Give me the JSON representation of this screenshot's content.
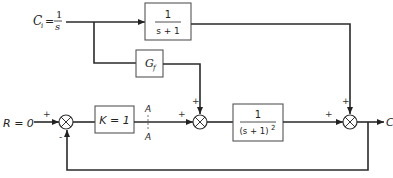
{
  "diagram": {
    "type": "block-diagram",
    "inputs": {
      "reference": {
        "label": "R = 0"
      },
      "disturbance": {
        "label_var": "C",
        "label_sub": "i",
        "label_eq": "=",
        "num": "1",
        "den": "s"
      }
    },
    "output": {
      "label": "C"
    },
    "blocks": [
      {
        "id": "feedforward-plant",
        "num": "1",
        "den": "s + 1"
      },
      {
        "id": "feedforward-gain",
        "label": "G",
        "sub": "f"
      },
      {
        "id": "controller",
        "label": "K = 1"
      },
      {
        "id": "plant",
        "num": "1",
        "den": "(s + 1)",
        "den_exp": "2"
      }
    ],
    "break_point": {
      "top": "A",
      "bottom": "A"
    },
    "summing_junctions": [
      {
        "id": "sum1",
        "signs": [
          "+",
          "-"
        ]
      },
      {
        "id": "sum2",
        "signs": [
          "+",
          "+"
        ]
      },
      {
        "id": "sum3",
        "signs": [
          "+",
          "+"
        ]
      }
    ]
  }
}
